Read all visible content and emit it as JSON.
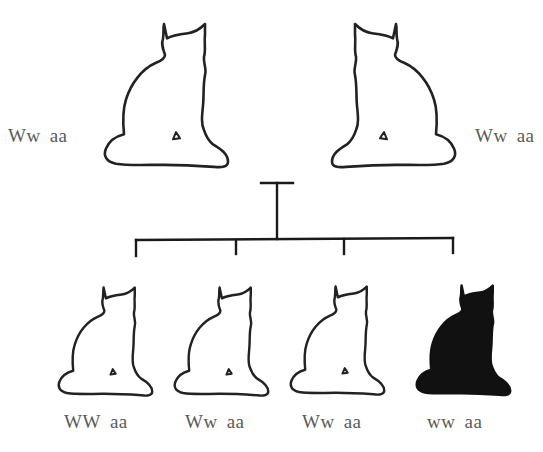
{
  "diagram": {
    "type": "pedigree",
    "parents": [
      {
        "id": "parent-left",
        "genotype_w": "Ww",
        "genotype_a": "aa",
        "phenotype": "white",
        "facing": "right"
      },
      {
        "id": "parent-right",
        "genotype_w": "Ww",
        "genotype_a": "aa",
        "phenotype": "white",
        "facing": "left"
      }
    ],
    "offspring": [
      {
        "id": "child-1",
        "genotype_w": "WW",
        "genotype_a": "aa",
        "phenotype": "white"
      },
      {
        "id": "child-2",
        "genotype_w": "Ww",
        "genotype_a": "aa",
        "phenotype": "white"
      },
      {
        "id": "child-3",
        "genotype_w": "Ww",
        "genotype_a": "aa",
        "phenotype": "white"
      },
      {
        "id": "child-4",
        "genotype_w": "ww",
        "genotype_a": "aa",
        "phenotype": "black"
      }
    ],
    "colors": {
      "outline": "#222222",
      "white_fill": "#ffffff",
      "black_fill": "#111111",
      "line": "#1a1a1a",
      "text": "#5a5a5a"
    }
  }
}
